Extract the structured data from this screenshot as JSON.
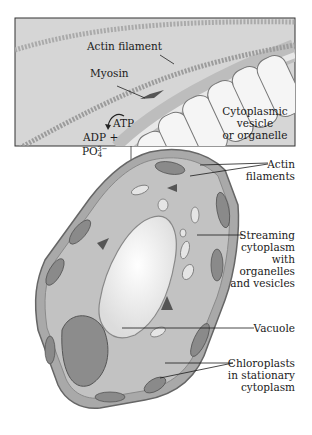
{
  "figure": {
    "type": "biological illustration"
  },
  "inset": {
    "labels": {
      "actin_filament": "Actin filament",
      "myosin": "Myosin",
      "atp": "ATP",
      "adp": "ADP +",
      "phosphate_base": "PO",
      "phosphate_sub": "4",
      "phosphate_sup": "3−",
      "vesicle_line1": "Cytoplasmic",
      "vesicle_line2": "vesicle",
      "vesicle_line3": "or organelle"
    }
  },
  "cell": {
    "labels": {
      "actin_filaments_line1": "Actin",
      "actin_filaments_line2": "filaments",
      "streaming_line1": "Streaming",
      "streaming_line2": "cytoplasm",
      "streaming_line3": "with",
      "streaming_line4": "organelles",
      "streaming_line5": "and vesicles",
      "vacuole": "Vacuole",
      "chloroplasts_line1": "Chloroplasts",
      "chloroplasts_line2": "in stationary",
      "chloroplasts_line3": "cytoplasm"
    }
  },
  "colors": {
    "inset_bg": "#d9d9d9",
    "cell_wall": "#9a9a9a",
    "cytoplasm": "#b8b8b8",
    "vacuole": "#f2f2f2",
    "chloroplast": "#7d7d7d",
    "arrow": "#555555",
    "line": "#1a1a1a"
  }
}
